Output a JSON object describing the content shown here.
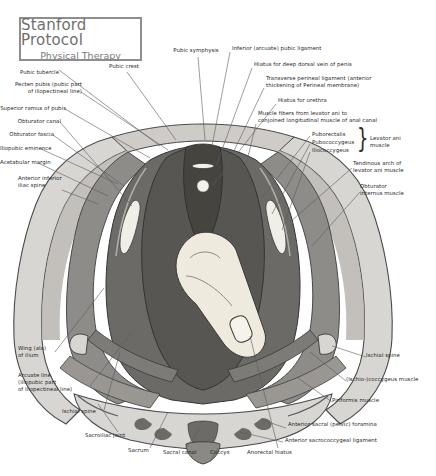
{
  "title_plate": {
    "line1": "Stanford Protocol",
    "line2": "Physical Therapy",
    "border_color": "#8e8e8e",
    "text_color": "#6f6f6f"
  },
  "figure": {
    "name": "female-male-pelvic-floor-superior-view",
    "palette": {
      "bone_light": "#d8d6d2",
      "bone_mid": "#b8b5b0",
      "muscle_mid": "#8e8c88",
      "muscle_dark": "#6b6a67",
      "muscle_darkest": "#4e4d4b",
      "organ_pale": "#efeade",
      "outline": "#3a3a3a",
      "leader_line": "#5a5a5a",
      "background": "#ffffff"
    }
  },
  "labels_left": [
    {
      "id": "pubic-tubercle",
      "text": "Pubic tubercle",
      "x": 56,
      "y": 72,
      "align": "right"
    },
    {
      "id": "pecten-pubis",
      "text": "Pecten pubis (pubic part\nof iliopectineal line)",
      "x": 78,
      "y": 86,
      "align": "right"
    },
    {
      "id": "superior-ramus-of-pubis",
      "text": "Superior ramus of pubis",
      "x": 62,
      "y": 107,
      "align": "right"
    },
    {
      "id": "obturator-canal",
      "text": "Obturator canal",
      "x": 57,
      "y": 120,
      "align": "right"
    },
    {
      "id": "obturator-fascia",
      "text": "Obturator fascia",
      "x": 50,
      "y": 133,
      "align": "right"
    },
    {
      "id": "iliopubic-eminence",
      "text": "Iliopubic eminence",
      "x": 38,
      "y": 147,
      "align": "right"
    },
    {
      "id": "acetabular-margin",
      "text": "Acetabular margin",
      "x": 35,
      "y": 161,
      "align": "right"
    },
    {
      "id": "anterior-inferior-iliac-spine",
      "text": "Anterior inferior\niliac spine",
      "x": 18,
      "y": 178,
      "align": "left"
    },
    {
      "id": "wing-ala-of-ilium",
      "text": "Wing (ala)\nof ilium",
      "x": 18,
      "y": 348,
      "align": "left"
    },
    {
      "id": "arcuate-line",
      "text": "Arcuate line\n(iliopubic part\nof iliopectineal line)",
      "x": 18,
      "y": 375,
      "align": "left"
    },
    {
      "id": "ischial-spine-left",
      "text": "Ischial spine",
      "x": 62,
      "y": 411,
      "align": "left"
    }
  ],
  "labels_top": [
    {
      "id": "pubic-crest",
      "text": "Pubic crest",
      "x": 123,
      "y": 66,
      "align": "center"
    },
    {
      "id": "pubic-symphysis",
      "text": "Pubic symphysis",
      "x": 196,
      "y": 50,
      "align": "center"
    }
  ],
  "labels_right": [
    {
      "id": "inferior-arcuate-pubic-ligament",
      "text": "Inferior (arcuate) pubic ligament",
      "x": 232,
      "y": 48,
      "align": "left"
    },
    {
      "id": "hiatus-deep-dorsal-vein-penis",
      "text": "Hiatus for deep dorsal vein of penis",
      "x": 254,
      "y": 64,
      "align": "left"
    },
    {
      "id": "transverse-perineal-ligament",
      "text": "Transverse perineal ligament (anterior\nthickening of Perineal membrane)",
      "x": 266,
      "y": 78,
      "align": "left"
    },
    {
      "id": "hiatus-for-urethra",
      "text": "Hiatus for urethra",
      "x": 278,
      "y": 100,
      "align": "left"
    },
    {
      "id": "muscle-fibers-levator-ani",
      "text": "Muscle fibers from levator ani to\nconjoined longitudinal muscle of anal canal",
      "x": 258,
      "y": 113,
      "align": "left"
    },
    {
      "id": "puborectalis",
      "text": "Puborectalis",
      "x": 312,
      "y": 134,
      "align": "left"
    },
    {
      "id": "pubococcygeus",
      "text": "Pubococcygeus",
      "x": 312,
      "y": 142,
      "align": "left"
    },
    {
      "id": "iliococcygeus",
      "text": "Iliococcygeus",
      "x": 312,
      "y": 150,
      "align": "left"
    },
    {
      "id": "levator-ani-muscle",
      "text": "Levator ani\nmuscle",
      "x": 372,
      "y": 138,
      "align": "left"
    },
    {
      "id": "tendinous-arch-levator-ani",
      "text": "Tendinous arch of\nlevator ani muscle",
      "x": 355,
      "y": 163,
      "align": "left"
    },
    {
      "id": "obturator-internus-muscle",
      "text": "Obturator\ninternus muscle",
      "x": 362,
      "y": 186,
      "align": "left"
    },
    {
      "id": "ischial-spine-right",
      "text": "Ischial spine",
      "x": 368,
      "y": 355,
      "align": "left"
    },
    {
      "id": "ischio-coccygeus-muscle",
      "text": "(Ischio-)coccygeus muscle",
      "x": 348,
      "y": 379,
      "align": "left"
    },
    {
      "id": "piriformis-muscle",
      "text": "Piriformis muscle",
      "x": 334,
      "y": 400,
      "align": "left"
    }
  ],
  "labels_bottom": [
    {
      "id": "sacroiliac-joint",
      "text": "Sacroiliac joint",
      "x": 85,
      "y": 435,
      "align": "left"
    },
    {
      "id": "sacrum",
      "text": "Sacrum",
      "x": 128,
      "y": 450,
      "align": "left"
    },
    {
      "id": "sacral-canal",
      "text": "Sacral canal",
      "x": 163,
      "y": 452,
      "align": "left"
    },
    {
      "id": "coccyx",
      "text": "Coccyx",
      "x": 210,
      "y": 452,
      "align": "left"
    },
    {
      "id": "anorectal-hiatus",
      "text": "Anorectal hiatus",
      "x": 247,
      "y": 452,
      "align": "left"
    },
    {
      "id": "anterior-sacral-pelvic-foramina",
      "text": "Anterior sacral (pelvic) foramina",
      "x": 288,
      "y": 424,
      "align": "left"
    },
    {
      "id": "anterior-sacrococcygeal-ligament",
      "text": "Anterior sacrococcygeal ligament",
      "x": 285,
      "y": 440,
      "align": "left"
    }
  ]
}
